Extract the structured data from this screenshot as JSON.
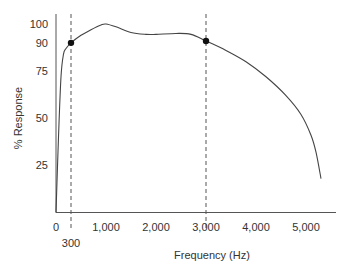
{
  "chart_data": {
    "type": "line",
    "title": "",
    "xlabel": "Frequency (Hz)",
    "ylabel": "% Response",
    "xlim": [
      0,
      5500
    ],
    "ylim": [
      0,
      100
    ],
    "grid": false,
    "legend": null,
    "x_ticks": [
      {
        "value": 0,
        "label": "0"
      },
      {
        "value": 1000,
        "label": "1,000"
      },
      {
        "value": 2000,
        "label": "2,000"
      },
      {
        "value": 3000,
        "label": "3,000"
      },
      {
        "value": 4000,
        "label": "4,000"
      },
      {
        "value": 5000,
        "label": "5,000"
      }
    ],
    "x_extra_tick": {
      "value": 300,
      "label": "300"
    },
    "y_ticks": [
      {
        "value": 25,
        "label": "25"
      },
      {
        "value": 50,
        "label": "50"
      },
      {
        "value": 75,
        "label": "75"
      },
      {
        "value": 90,
        "label": "90"
      },
      {
        "value": 100,
        "label": "100"
      }
    ],
    "series": [
      {
        "name": "Frequency response",
        "x": [
          0,
          50,
          100,
          150,
          200,
          300,
          500,
          700,
          900,
          1000,
          1200,
          1500,
          1800,
          2000,
          2400,
          2700,
          3000,
          3400,
          3800,
          4200,
          4600,
          4900,
          5100,
          5200,
          5300
        ],
        "y": [
          0,
          40,
          72,
          84,
          87,
          90,
          94,
          97,
          99.5,
          100,
          98.5,
          95.5,
          94.5,
          94.5,
          95,
          94.5,
          91,
          86,
          80,
          72,
          62,
          52,
          41,
          32,
          18
        ]
      }
    ],
    "markers": [
      {
        "x": 300,
        "y": 90
      },
      {
        "x": 3000,
        "y": 91
      }
    ],
    "reference_lines": [
      {
        "orientation": "vertical",
        "x": 300,
        "style": "dashed"
      },
      {
        "orientation": "vertical",
        "x": 3000,
        "style": "dashed"
      }
    ]
  }
}
